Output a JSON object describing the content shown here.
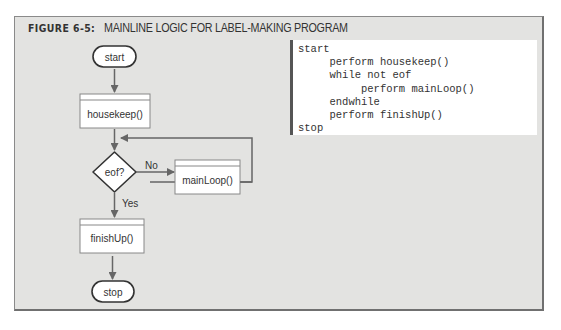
{
  "figure": {
    "number_label": "FIGURE 6-5:",
    "title": "MAINLINE LOGIC FOR LABEL-MAKING PROGRAM"
  },
  "flowchart": {
    "start": "start",
    "housekeep": "housekeep()",
    "decision": "eof?",
    "no_label": "No",
    "yes_label": "Yes",
    "mainloop": "mainLoop()",
    "finishup": "finishUp()",
    "stop": "stop"
  },
  "pseudocode": {
    "lines": [
      "start",
      "     perform housekeep()",
      "     while not eof",
      "          perform mainLoop()",
      "     endwhile",
      "     perform finishUp()",
      "stop"
    ]
  }
}
